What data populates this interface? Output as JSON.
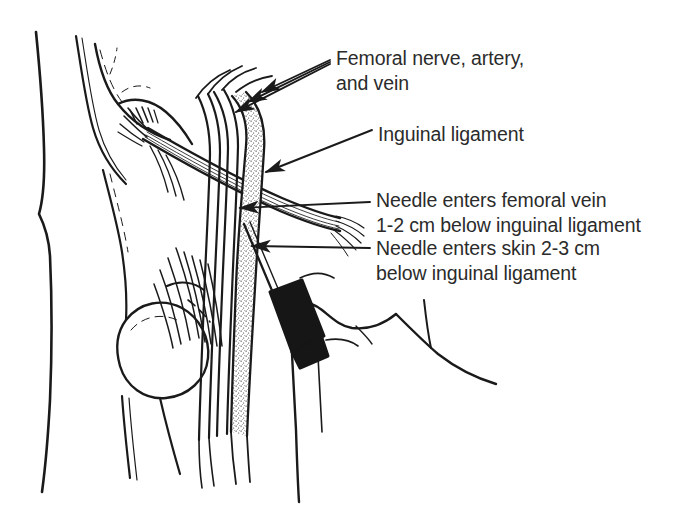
{
  "figure": {
    "background_color": "#ffffff",
    "ink_color": "#1a1a1a",
    "text_color": "#2b2b2b",
    "width": 700,
    "height": 512
  },
  "labels": [
    {
      "id": "femoral-bundle",
      "line1": "Femoral nerve, artery,",
      "line2": "and vein"
    },
    {
      "id": "inguinal-ligament",
      "line1": "Inguinal ligament",
      "line2": ""
    },
    {
      "id": "needle-vein",
      "line1": "Needle enters femoral vein",
      "line2": "1-2 cm below inguinal ligament"
    },
    {
      "id": "needle-skin",
      "line1": "Needle enters skin 2-3 cm",
      "line2": "below inguinal ligament"
    }
  ],
  "structures": {
    "body_outline": "torso-and-thigh-contour",
    "pelvis": "iliac-crest-and-femoral-head",
    "inguinal_ligament": "diagonal-fibrous-band",
    "femoral_vein": "stippled-vessel",
    "femoral_artery": "open-vessel",
    "femoral_nerve": "open-vessel",
    "syringe": "black-needle-hub",
    "muscle": "striated-fibers"
  }
}
